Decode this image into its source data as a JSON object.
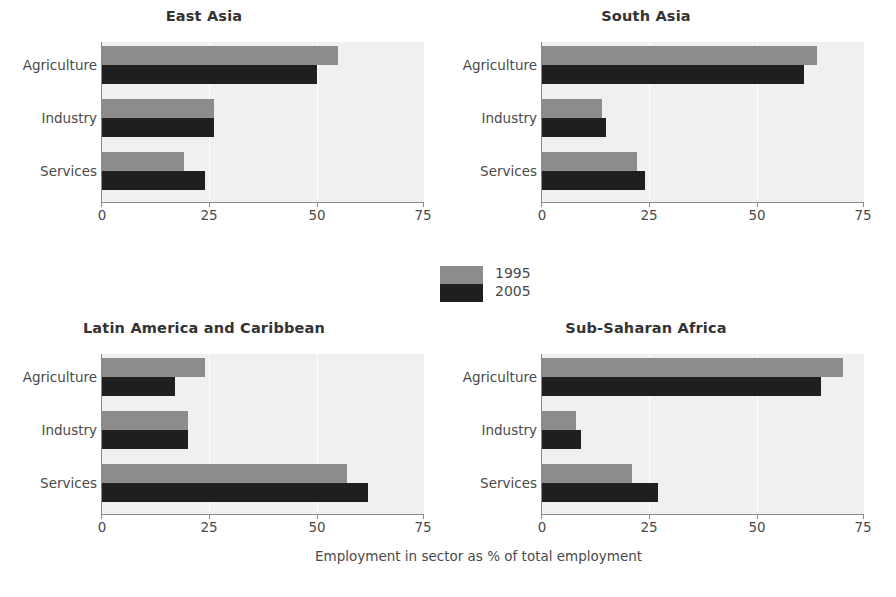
{
  "chart_data": {
    "type": "bar",
    "orientation": "horizontal",
    "title": "",
    "xlabel": "Employment in sector as % of total employment",
    "ylabel": "",
    "xlim": [
      0,
      75
    ],
    "xticks": [
      0,
      25,
      50,
      75
    ],
    "xtick_labels": [
      "0",
      "25",
      "50",
      "75"
    ],
    "categories": [
      "Agriculture",
      "Industry",
      "Services"
    ],
    "legend": {
      "position": "center",
      "entries": [
        {
          "name": "1995",
          "color": "#8c8c8c"
        },
        {
          "name": "2005",
          "color": "#1f1f1f"
        }
      ]
    },
    "grid": "vertical-white",
    "panels": [
      {
        "title": "East Asia",
        "series": [
          {
            "name": "1995",
            "values": [
              55,
              26,
              19
            ]
          },
          {
            "name": "2005",
            "values": [
              50,
              26,
              24
            ]
          }
        ]
      },
      {
        "title": "South Asia",
        "series": [
          {
            "name": "1995",
            "values": [
              64,
              14,
              22
            ]
          },
          {
            "name": "2005",
            "values": [
              61,
              15,
              24
            ]
          }
        ]
      },
      {
        "title": "Latin America and Caribbean",
        "series": [
          {
            "name": "1995",
            "values": [
              24,
              20,
              57
            ]
          },
          {
            "name": "2005",
            "values": [
              17,
              20,
              62
            ]
          }
        ]
      },
      {
        "title": "Sub-Saharan Africa",
        "series": [
          {
            "name": "1995",
            "values": [
              70,
              8,
              21
            ]
          },
          {
            "name": "2005",
            "values": [
              65,
              9,
              27
            ]
          }
        ]
      }
    ]
  },
  "figure": {
    "background_color": "#ffffff",
    "plot_background_color": "#f0f0f0",
    "axis_color": "#8a8a8a"
  }
}
